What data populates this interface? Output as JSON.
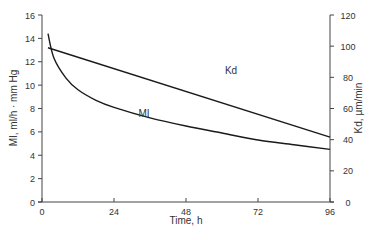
{
  "chart_data": {
    "type": "line",
    "title": "",
    "xlabel": "Time, h",
    "ylabel": "MI, ml/h · mm Hg",
    "y2label": "Kd, µm/min",
    "xlim": [
      0,
      96
    ],
    "ylim": [
      0,
      16
    ],
    "y2lim": [
      0,
      120
    ],
    "x_ticks": [
      0,
      24,
      48,
      72,
      96
    ],
    "y_ticks": [
      0,
      2,
      4,
      6,
      8,
      10,
      12,
      14,
      16
    ],
    "y2_ticks": [
      0,
      20,
      40,
      60,
      80,
      100,
      120
    ],
    "grid": false,
    "legend": "inline labels",
    "series": [
      {
        "name": "MI",
        "axis": "left",
        "label_pos": {
          "x": 34,
          "y": 7.3
        },
        "x": [
          2,
          4,
          8,
          12,
          18,
          24,
          36,
          48,
          60,
          72,
          84,
          96
        ],
        "values": [
          14.4,
          12.3,
          10.6,
          9.6,
          8.7,
          8.1,
          7.2,
          6.5,
          5.9,
          5.3,
          4.9,
          4.5
        ]
      },
      {
        "name": "Kd",
        "axis": "right",
        "label_pos": {
          "x": 63,
          "y": 82
        },
        "x": [
          2,
          96
        ],
        "values": [
          99,
          41.6
        ]
      }
    ]
  }
}
